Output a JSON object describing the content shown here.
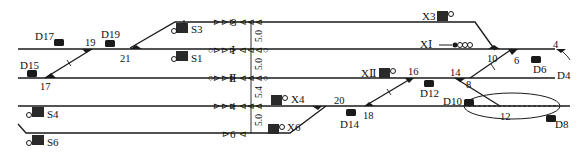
{
  "diagram": {
    "type": "railway-station-track-layout",
    "tracks": [
      {
        "id": "3",
        "label": "3"
      },
      {
        "id": "I",
        "label": "Ⅰ"
      },
      {
        "id": "II",
        "label": "Ⅱ"
      },
      {
        "id": "4",
        "label": "4"
      },
      {
        "id": "6",
        "label": "6"
      }
    ],
    "track_spacing": [
      {
        "between": [
          "3",
          "I"
        ],
        "value": "5.0"
      },
      {
        "between": [
          "I",
          "II"
        ],
        "value": "5.0"
      },
      {
        "between": [
          "II",
          "4"
        ],
        "value": "5.4"
      },
      {
        "between": [
          "4",
          "6"
        ],
        "value": "5.0"
      }
    ],
    "switches": [
      "19",
      "21",
      "17",
      "10",
      "6",
      "4",
      "16",
      "14",
      "8",
      "20",
      "18",
      "12"
    ],
    "shunting_signals": [
      "D17",
      "D19",
      "D15",
      "D6",
      "D4",
      "D12",
      "D10",
      "D14",
      "D8"
    ],
    "departure_signals_down": [
      "S3",
      "S1",
      "S4",
      "S6"
    ],
    "departure_signals_up": [
      "X3",
      "XⅠ",
      "XⅡ",
      "X4",
      "X6"
    ]
  },
  "labels": {
    "track3": "3",
    "trackI": "Ⅰ",
    "trackII": "Ⅱ",
    "track4": "4",
    "track6": "6",
    "sp1": "5.0",
    "sp2": "5.0",
    "sp3": "5.4",
    "sp4": "5.0",
    "sw19": "19",
    "sw21": "21",
    "sw17": "17",
    "sw10": "10",
    "sw6": "6",
    "sw4": "4",
    "sw16": "16",
    "sw14": "14",
    "sw8": "8",
    "sw20": "20",
    "sw18": "18",
    "sw12": "12",
    "D17": "D17",
    "D19": "D19",
    "D15": "D15",
    "D6": "D6",
    "D4": "D4",
    "D12": "D12",
    "D10": "D10",
    "D14": "D14",
    "D8": "D8",
    "S3": "S3",
    "S1": "S1",
    "S4": "S4",
    "S6": "S6",
    "X3": "X3",
    "XI": "XⅠ",
    "XII": "XⅡ",
    "X4": "X4",
    "X6": "X6"
  }
}
